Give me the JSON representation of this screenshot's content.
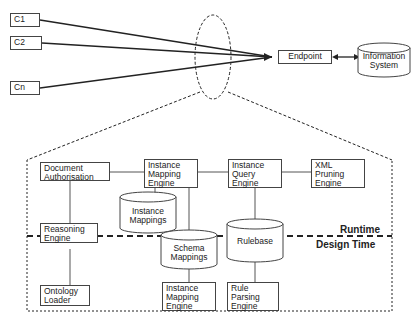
{
  "clients": [
    "C1",
    "C2",
    "Cn"
  ],
  "endpoint": "Endpoint",
  "information_system": [
    "Information",
    "System"
  ],
  "components": {
    "document_authorisation": [
      "Document",
      "Authorisation"
    ],
    "instance_mapping_engine_top": [
      "Instance",
      "Mapping",
      "Engine"
    ],
    "instance_query_engine": [
      "Instance",
      "Query",
      "Engine"
    ],
    "xml_pruning_engine": [
      "XML",
      "Pruning",
      "Engine"
    ],
    "instance_mappings": [
      "Instance",
      "Mappings"
    ],
    "reasoning_engine": [
      "Reasoning",
      "Engine"
    ],
    "schema_mappings": [
      "Schema",
      "Mappings"
    ],
    "rulebase": [
      "Rulebase"
    ],
    "ontology_loader": [
      "Ontology",
      "Loader"
    ],
    "instance_mapping_engine_bottom": [
      "Instance",
      "Mapping",
      "Engine"
    ],
    "rule_parsing_engine": [
      "Rule",
      "Parsing",
      "Engine"
    ]
  },
  "zones": {
    "runtime": "Runtime",
    "design_time": "Design Time"
  }
}
